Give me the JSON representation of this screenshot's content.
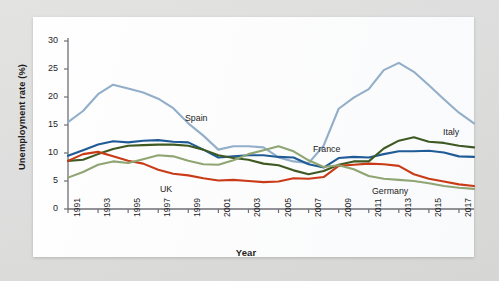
{
  "chart_data": {
    "type": "line",
    "title": "",
    "xlabel": "Year",
    "ylabel": "Unemployment rate (%)",
    "xlim": [
      1991,
      2018
    ],
    "ylim": [
      0,
      30
    ],
    "ytick_step": 5,
    "xtick_step": 2,
    "grid": false,
    "legend": "inline-annotations",
    "yticks": [
      "0",
      "5",
      "10",
      "15",
      "20",
      "25",
      "30"
    ],
    "xticks": [
      "1991",
      "1993",
      "1995",
      "1997",
      "1999",
      "2001",
      "2003",
      "2005",
      "2007",
      "2009",
      "2011",
      "2013",
      "2015",
      "2017"
    ],
    "x": [
      1991,
      1992,
      1993,
      1994,
      1995,
      1996,
      1997,
      1998,
      1999,
      2000,
      2001,
      2002,
      2003,
      2004,
      2005,
      2006,
      2007,
      2008,
      2009,
      2010,
      2011,
      2012,
      2013,
      2014,
      2015,
      2016,
      2017,
      2018
    ],
    "series": [
      {
        "name": "Spain",
        "color": "#93aec9",
        "label_x": 185,
        "label_y": 113,
        "values": [
          15.5,
          17.5,
          20.5,
          22.2,
          21.5,
          20.8,
          19.7,
          18.0,
          15.3,
          13.1,
          10.6,
          11.2,
          11.2,
          11.0,
          9.2,
          8.5,
          8.2,
          11.3,
          17.9,
          19.9,
          21.4,
          24.8,
          26.1,
          24.5,
          22.1,
          19.6,
          17.2,
          15.3
        ]
      },
      {
        "name": "France",
        "color": "#1f5b96",
        "label_x": 313,
        "label_y": 144,
        "values": [
          9.5,
          10.5,
          11.5,
          12.1,
          11.9,
          12.2,
          12.3,
          12.0,
          11.9,
          10.6,
          9.2,
          9.4,
          9.6,
          9.6,
          9.3,
          9.2,
          8.0,
          7.4,
          9.1,
          9.3,
          9.2,
          9.8,
          10.3,
          10.3,
          10.4,
          10.1,
          9.4,
          9.3
        ]
      },
      {
        "name": "Italy",
        "color": "#3e5a22",
        "label_x": 443,
        "label_y": 127,
        "values": [
          8.6,
          8.8,
          9.8,
          10.7,
          11.3,
          11.4,
          11.5,
          11.5,
          11.3,
          10.6,
          9.6,
          9.1,
          8.8,
          8.1,
          7.8,
          6.9,
          6.2,
          6.8,
          7.9,
          8.5,
          8.5,
          10.8,
          12.2,
          12.8,
          12.0,
          11.8,
          11.3,
          11.0
        ]
      },
      {
        "name": "UK",
        "color": "#c93b16",
        "label_x": 160,
        "label_y": 184,
        "values": [
          8.6,
          9.8,
          10.2,
          9.4,
          8.6,
          8.1,
          7.0,
          6.3,
          6.0,
          5.5,
          5.1,
          5.2,
          5.0,
          4.8,
          4.9,
          5.5,
          5.4,
          5.7,
          7.7,
          7.9,
          8.1,
          8.0,
          7.7,
          6.2,
          5.4,
          4.9,
          4.4,
          4.1
        ]
      },
      {
        "name": "Germany",
        "color": "#8fa573",
        "label_x": 372,
        "label_y": 186,
        "values": [
          5.6,
          6.6,
          7.9,
          8.5,
          8.2,
          8.9,
          9.6,
          9.4,
          8.6,
          8.0,
          7.9,
          8.7,
          9.8,
          10.5,
          11.2,
          10.3,
          8.7,
          7.5,
          7.8,
          7.1,
          5.9,
          5.4,
          5.2,
          5.0,
          4.6,
          4.1,
          3.8,
          3.6
        ]
      }
    ]
  }
}
